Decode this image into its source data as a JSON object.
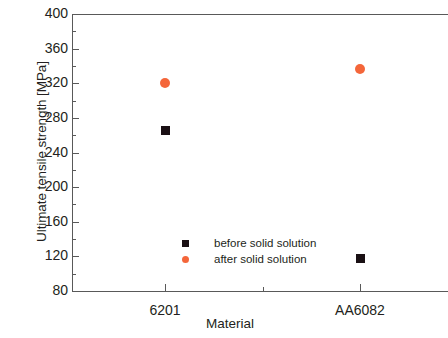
{
  "chart_data": {
    "type": "scatter",
    "title": "",
    "xlabel": "Material",
    "ylabel": "Ultimate tensile strength [MPa]",
    "categories": [
      "6201",
      "AA6082"
    ],
    "ylim": [
      80,
      400
    ],
    "ytick_step": 40,
    "yminor_step": 20,
    "grid": false,
    "legend_position": "inside-lower-left",
    "series": [
      {
        "name": "before solid solution",
        "marker": "square",
        "color": "#1a1014",
        "values": [
          265,
          118
        ]
      },
      {
        "name": "after solid solution",
        "marker": "circle",
        "color": "#f4663a",
        "values": [
          320,
          336
        ]
      }
    ]
  },
  "axes": {
    "y_ticks": [
      "400",
      "360",
      "320",
      "280",
      "240",
      "200",
      "160",
      "120",
      "80"
    ],
    "x_ticks": [
      "6201",
      "AA6082"
    ],
    "axis_color": "#595959"
  },
  "legend": {
    "items": [
      {
        "label": "before solid solution",
        "marker": "square-marker-icon"
      },
      {
        "label": "after solid solution",
        "marker": "circle-marker-icon"
      }
    ]
  }
}
